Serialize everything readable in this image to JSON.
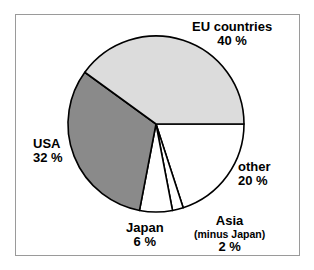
{
  "chart_data": {
    "type": "pie",
    "title": "",
    "categories": [
      "EU countries",
      "USA",
      "other",
      "Japan",
      "Asia"
    ],
    "values": [
      40,
      32,
      20,
      6,
      2
    ],
    "unit": "%",
    "legend_position": "callout-labels",
    "slices": [
      {
        "name": "other",
        "label": "other",
        "value_label": "20 %",
        "value": 20,
        "fill": "#ffffff",
        "start_angle": 0,
        "end_angle": 72
      },
      {
        "name": "asia",
        "label": "Asia",
        "sublabel": "(minus Japan)",
        "value_label": "2 %",
        "value": 2,
        "fill": "#ffffff",
        "start_angle": 72,
        "end_angle": 79.2
      },
      {
        "name": "japan",
        "label": "Japan",
        "value_label": "6 %",
        "value": 6,
        "fill": "#ffffff",
        "start_angle": 79.2,
        "end_angle": 100.8
      },
      {
        "name": "usa",
        "label": "USA",
        "value_label": "32 %",
        "value": 32,
        "fill": "#8a8a8a",
        "start_angle": 100.8,
        "end_angle": 216
      },
      {
        "name": "eu-countries",
        "label": "EU countries",
        "value_label": "40 %",
        "value": 40,
        "fill": "#dcdcdc",
        "start_angle": 216,
        "end_angle": 360
      }
    ],
    "colors": {
      "eu_countries": "#dcdcdc",
      "usa": "#8a8a8a",
      "other": "#ffffff",
      "japan": "#ffffff",
      "asia": "#ffffff",
      "outline": "#000000",
      "frame": "#9a9a9a",
      "background": "#ffffff"
    },
    "geometry": {
      "center_x": 156,
      "center_y": 124,
      "radius": 88
    }
  }
}
